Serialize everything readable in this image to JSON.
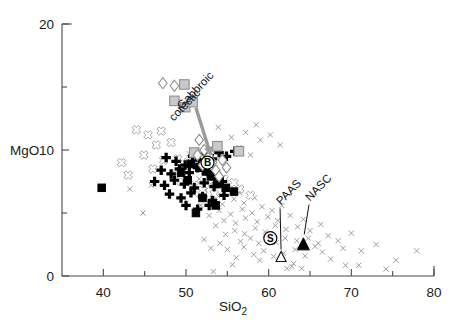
{
  "chart_data": {
    "type": "scatter",
    "title": "",
    "xlabel": "SiO2",
    "xlabel_display": "SiO",
    "xlabel_sub": "2",
    "ylabel": "MgO",
    "xlim": [
      35,
      80
    ],
    "ylim": [
      0,
      20
    ],
    "xticks_major": [
      40,
      50,
      60,
      70,
      80
    ],
    "xticks_minor": [
      45,
      55,
      65,
      75
    ],
    "xtick_labels": [
      "40",
      "50",
      "60",
      "70",
      "80"
    ],
    "yticks_major": [
      0,
      10,
      20
    ],
    "yticks_minor": [
      5,
      15
    ],
    "ytick_labels": [
      "0",
      "10",
      "20"
    ],
    "grid": false,
    "legend": "none",
    "annotations": [
      {
        "name": "gabbroic-cotectic",
        "text": "Gabbroic cotectic",
        "line1": "Gabbroic",
        "line2": "cotectic",
        "x": 49.5,
        "y": 13.2,
        "rotation": -46,
        "arrow_to_x": 53.0,
        "arrow_to_y": 9.6,
        "color": "#9a9a9a"
      },
      {
        "name": "paas",
        "text": "PAAS",
        "x": 61.5,
        "y": 5.6,
        "rotation": -46,
        "points_to_x": 61.5,
        "points_to_y": 2.1
      },
      {
        "name": "nasc",
        "text": "NASC",
        "x": 65.0,
        "y": 5.9,
        "rotation": -46,
        "points_to_x": 64.3,
        "points_to_y": 3.3
      },
      {
        "name": "basalt-reference",
        "text": "B",
        "x": 52.6,
        "y": 9.0
      },
      {
        "name": "shale-reference",
        "text": "S",
        "x": 60.2,
        "y": 3.0
      }
    ],
    "series": [
      {
        "name": "gray-x-sediments",
        "marker": "x",
        "color": "#8d8d8d",
        "points": [
          [
            53.3,
            0.35
          ],
          [
            55.6,
            0.9
          ],
          [
            58.9,
            1.25
          ],
          [
            62.2,
            0.6
          ],
          [
            62.8,
            0.75
          ],
          [
            63.0,
            1.0
          ],
          [
            64.0,
            0.6
          ],
          [
            67.5,
            1.35
          ],
          [
            69.3,
            0.85
          ],
          [
            70.9,
            0.85
          ],
          [
            74.2,
            0.55
          ],
          [
            75.4,
            1.25
          ],
          [
            77.9,
            2.0
          ],
          [
            73.0,
            2.5
          ],
          [
            71.2,
            2.0
          ],
          [
            69.0,
            2.2
          ],
          [
            66.5,
            1.9
          ],
          [
            65.6,
            2.35
          ],
          [
            64.4,
            1.6
          ],
          [
            63.2,
            2.1
          ],
          [
            61.8,
            1.8
          ],
          [
            60.6,
            1.55
          ],
          [
            59.4,
            2.0
          ],
          [
            58.2,
            1.7
          ],
          [
            57.0,
            2.3
          ],
          [
            56.1,
            1.45
          ],
          [
            55.0,
            2.1
          ],
          [
            54.1,
            2.6
          ],
          [
            53.0,
            2.2
          ],
          [
            52.2,
            2.9
          ],
          [
            56.6,
            2.75
          ],
          [
            57.8,
            3.0
          ],
          [
            58.8,
            2.6
          ],
          [
            59.8,
            3.1
          ],
          [
            60.9,
            2.65
          ],
          [
            62.0,
            3.0
          ],
          [
            63.4,
            2.8
          ],
          [
            64.8,
            3.0
          ],
          [
            66.0,
            2.6
          ],
          [
            67.2,
            3.2
          ],
          [
            68.4,
            2.8
          ],
          [
            70.0,
            3.4
          ],
          [
            54.8,
            3.3
          ],
          [
            55.9,
            3.6
          ],
          [
            57.1,
            3.35
          ],
          [
            58.4,
            3.8
          ],
          [
            59.6,
            3.5
          ],
          [
            60.8,
            4.0
          ],
          [
            62.1,
            3.7
          ],
          [
            63.5,
            3.9
          ],
          [
            65.0,
            3.6
          ],
          [
            66.3,
            4.1
          ],
          [
            53.6,
            4.0
          ],
          [
            54.6,
            4.4
          ],
          [
            56.0,
            4.2
          ],
          [
            57.2,
            4.6
          ],
          [
            58.6,
            4.3
          ],
          [
            59.9,
            4.7
          ],
          [
            61.1,
            4.4
          ],
          [
            62.6,
            4.8
          ],
          [
            64.2,
            4.5
          ],
          [
            52.8,
            4.8
          ],
          [
            54.0,
            5.2
          ],
          [
            55.4,
            4.9
          ],
          [
            56.8,
            5.3
          ],
          [
            58.0,
            5.0
          ],
          [
            59.2,
            5.5
          ],
          [
            60.4,
            5.2
          ],
          [
            61.6,
            5.6
          ],
          [
            51.8,
            5.6
          ],
          [
            53.2,
            6.0
          ],
          [
            54.4,
            5.7
          ],
          [
            55.8,
            6.1
          ],
          [
            57.0,
            5.8
          ],
          [
            58.3,
            6.2
          ],
          [
            51.0,
            6.5
          ],
          [
            52.4,
            6.8
          ],
          [
            53.8,
            6.4
          ],
          [
            55.2,
            6.9
          ],
          [
            56.5,
            6.6
          ],
          [
            50.2,
            7.4
          ],
          [
            51.6,
            7.7
          ],
          [
            53.0,
            7.3
          ],
          [
            54.4,
            7.8
          ],
          [
            49.6,
            8.4
          ],
          [
            51.0,
            8.7
          ],
          [
            52.3,
            8.2
          ],
          [
            48.9,
            9.4
          ],
          [
            50.4,
            9.7
          ],
          [
            51.8,
            9.2
          ],
          [
            53.4,
            9.8
          ],
          [
            54.8,
            9.4
          ],
          [
            56.4,
            10.2
          ],
          [
            57.8,
            9.6
          ],
          [
            59.0,
            10.8
          ],
          [
            55.5,
            11.0
          ],
          [
            57.2,
            11.4
          ],
          [
            53.9,
            11.8
          ],
          [
            58.5,
            12.0
          ],
          [
            60.2,
            11.2
          ],
          [
            61.4,
            10.4
          ],
          [
            44.8,
            5.0
          ],
          [
            43.2,
            6.9
          ],
          [
            45.8,
            7.2
          ]
        ]
      },
      {
        "name": "open-gray-crosses",
        "marker": "bold-cross-outline",
        "color": "#9b9b9b",
        "points": [
          [
            44.0,
            11.6
          ],
          [
            45.4,
            11.2
          ],
          [
            47.0,
            11.5
          ],
          [
            46.4,
            10.4
          ],
          [
            48.2,
            10.6
          ],
          [
            44.9,
            9.6
          ],
          [
            47.3,
            9.2
          ],
          [
            49.0,
            9.3
          ],
          [
            50.2,
            9.0
          ],
          [
            46.0,
            8.5
          ],
          [
            48.6,
            8.1
          ],
          [
            50.0,
            8.4
          ],
          [
            51.2,
            8.8
          ],
          [
            52.4,
            8.5
          ],
          [
            53.6,
            8.2
          ],
          [
            54.6,
            7.7
          ],
          [
            55.8,
            7.4
          ],
          [
            51.0,
            7.2
          ],
          [
            49.4,
            7.5
          ],
          [
            52.0,
            6.8
          ],
          [
            53.4,
            6.5
          ],
          [
            56.5,
            6.9
          ],
          [
            57.8,
            6.4
          ],
          [
            43.0,
            8.0
          ],
          [
            42.2,
            9.0
          ]
        ]
      },
      {
        "name": "black-bold-crosses",
        "marker": "bold-cross",
        "color": "#000000",
        "points": [
          [
            47.6,
            9.4
          ],
          [
            48.8,
            9.1
          ],
          [
            49.9,
            8.8
          ],
          [
            50.8,
            9.5
          ],
          [
            51.6,
            9.2
          ],
          [
            52.3,
            9.7
          ],
          [
            53.2,
            9.3
          ],
          [
            54.0,
            9.8
          ],
          [
            54.9,
            9.5
          ],
          [
            55.9,
            9.9
          ],
          [
            47.0,
            8.4
          ],
          [
            48.2,
            8.1
          ],
          [
            49.2,
            8.5
          ],
          [
            50.4,
            8.2
          ],
          [
            51.4,
            8.6
          ],
          [
            52.6,
            8.3
          ],
          [
            53.5,
            8.0
          ],
          [
            46.2,
            7.5
          ],
          [
            47.4,
            7.2
          ],
          [
            48.6,
            7.6
          ],
          [
            49.8,
            7.3
          ],
          [
            51.0,
            7.0
          ],
          [
            52.2,
            7.4
          ],
          [
            53.4,
            7.1
          ],
          [
            54.4,
            7.5
          ],
          [
            48.0,
            6.5
          ],
          [
            49.4,
            6.2
          ],
          [
            50.6,
            6.6
          ],
          [
            52.0,
            6.3
          ],
          [
            53.2,
            6.0
          ],
          [
            54.6,
            6.4
          ],
          [
            50.0,
            5.6
          ],
          [
            51.4,
            5.3
          ],
          [
            52.8,
            5.6
          ]
        ]
      },
      {
        "name": "black-squares",
        "marker": "square",
        "color": "#000000",
        "points": [
          [
            39.8,
            7.0
          ],
          [
            50.6,
            8.9
          ],
          [
            51.6,
            8.6
          ],
          [
            52.4,
            8.3
          ],
          [
            53.0,
            7.9
          ],
          [
            53.8,
            7.3
          ],
          [
            54.8,
            7.0
          ],
          [
            55.8,
            6.7
          ],
          [
            52.0,
            6.2
          ],
          [
            53.6,
            5.6
          ],
          [
            51.2,
            5.0
          ],
          [
            50.2,
            7.6
          ],
          [
            49.4,
            8.2
          ]
        ]
      },
      {
        "name": "gray-squares",
        "marker": "square",
        "color": "#c9c9c9",
        "points": [
          [
            49.8,
            15.2
          ],
          [
            48.6,
            13.9
          ],
          [
            49.9,
            13.4
          ],
          [
            50.8,
            13.8
          ],
          [
            53.8,
            10.3
          ],
          [
            56.4,
            9.9
          ],
          [
            51.0,
            9.8
          ]
        ]
      },
      {
        "name": "open-diamonds",
        "marker": "diamond",
        "color": "#ffffff",
        "points": [
          [
            47.2,
            15.3
          ],
          [
            48.6,
            15.1
          ],
          [
            51.6,
            10.8
          ],
          [
            52.2,
            10.0
          ],
          [
            52.8,
            9.5
          ],
          [
            53.2,
            9.0
          ],
          [
            53.6,
            8.4
          ],
          [
            54.0,
            7.9
          ],
          [
            51.4,
            9.6
          ],
          [
            52.0,
            8.8
          ],
          [
            54.4,
            9.2
          ],
          [
            54.9,
            8.6
          ]
        ]
      },
      {
        "name": "paas-marker",
        "marker": "triangle-open",
        "color": "#ffffff",
        "points": [
          [
            61.5,
            1.55
          ]
        ]
      },
      {
        "name": "nasc-marker",
        "marker": "triangle-filled",
        "color": "#000000",
        "points": [
          [
            64.2,
            2.55
          ]
        ]
      }
    ]
  }
}
